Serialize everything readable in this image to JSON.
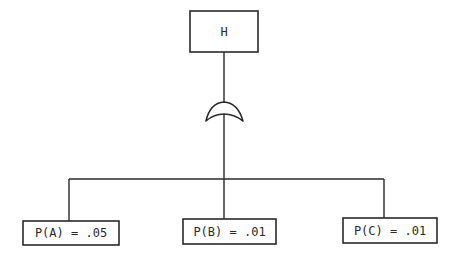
{
  "diagram": {
    "type": "fault-tree",
    "top_event": {
      "label": "H"
    },
    "gate": {
      "type": "OR"
    },
    "basic_events": [
      {
        "id": "A",
        "label": "P(A) = .05"
      },
      {
        "id": "B",
        "label": "P(B) = .01"
      },
      {
        "id": "C",
        "label": "P(C) = .01"
      }
    ]
  },
  "colors": {
    "line": "#2a2a2a",
    "background": "#ffffff"
  }
}
